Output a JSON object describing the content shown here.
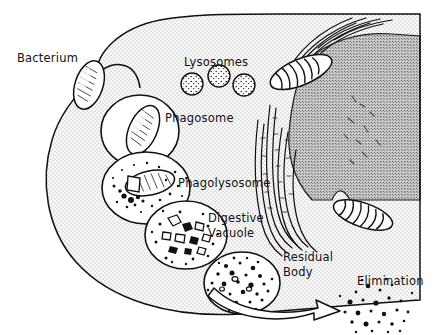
{
  "figure": {
    "background_color": "#ffffff",
    "ink_color": "#111111",
    "cytoplasm_color": "#d8d8d8",
    "nucleus_color": "#a9a9a9",
    "vesicle_color": "#ffffff"
  },
  "labels": {
    "bacterium": "Bacterium",
    "lysosomes": "Lysosomes",
    "phagosome": "Phagosome",
    "phagolysosome": "Phagolysosome",
    "digestive_vacuole_line1": "Digestive",
    "digestive_vacuole_line2": "Vacuole",
    "residual_body_line1": "Residual",
    "residual_body_line2": "Body",
    "elimination": "Elimination"
  },
  "structures": [
    {
      "name": "cell-membrane",
      "kind": "outline"
    },
    {
      "name": "cytoplasm",
      "kind": "stippled-region"
    },
    {
      "name": "nucleus",
      "kind": "stippled-region"
    },
    {
      "name": "endoplasmic-reticulum",
      "kind": "paired-curves",
      "count": 9
    },
    {
      "name": "mitochondrion-upper",
      "kind": "organelle-with-cristae"
    },
    {
      "name": "mitochondrion-lower",
      "kind": "organelle-with-cristae"
    },
    {
      "name": "free-bacterium",
      "kind": "rod-cell"
    },
    {
      "name": "lysosome-vesicles",
      "kind": "stippled-circles",
      "count": 3
    },
    {
      "name": "phagosome-vesicle",
      "kind": "vesicle-with-bacterium"
    },
    {
      "name": "phagolysosome-vesicle",
      "kind": "vesicle-with-degrading-bacterium"
    },
    {
      "name": "digestive-vacuole-vesicle",
      "kind": "vesicle-with-fragments"
    },
    {
      "name": "residual-body-vesicle",
      "kind": "vesicle-with-debris"
    },
    {
      "name": "elimination-arrow",
      "kind": "hollow-curved-arrow"
    },
    {
      "name": "expelled-debris",
      "kind": "scatter-dots"
    }
  ]
}
